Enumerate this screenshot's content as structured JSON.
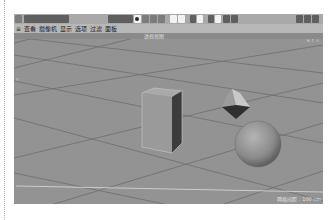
{
  "toolbar": {
    "left_buttons": [
      "box-icon",
      "undo-icon",
      "redo-icon",
      "select-icon",
      "move-icon"
    ],
    "center_buttons": [
      "live-select-icon",
      "move-icon",
      "pen-icon",
      "cube-icon",
      "render-icon",
      "render-settings-icon",
      "coordinate-icon",
      "x-axis-icon",
      "y-axis-icon",
      "z-axis-icon",
      "object-mode-icon",
      "model-icon",
      "texture-icon"
    ],
    "right_buttons": [
      "layout-icon",
      "window-icon",
      "panel-icon",
      "close-icon"
    ]
  },
  "menubar": {
    "items": [
      {
        "label": "≡"
      },
      {
        "label": "查看"
      },
      {
        "label": "摄像机"
      },
      {
        "label": "显示"
      },
      {
        "label": "选项"
      },
      {
        "label": "过滤"
      },
      {
        "label": "面板"
      }
    ]
  },
  "viewport": {
    "title": "透视视图",
    "corner_icons": "⊕ ⇕ ⊙",
    "axis_label": "Y",
    "status": "网格间距 : 100 cm",
    "colors": {
      "background": "#939393",
      "grid_line": "#6f6f6f",
      "horizon": "#d8d8d8"
    },
    "objects": [
      {
        "type": "cube",
        "label": "立方体"
      },
      {
        "type": "octahedron",
        "label": "宝石"
      },
      {
        "type": "sphere",
        "label": "球体"
      }
    ]
  }
}
